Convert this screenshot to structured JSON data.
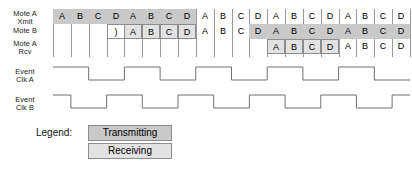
{
  "diagram": {
    "rows": [
      {
        "id": "mote-a-xmit",
        "label_line1": "Mote A",
        "label_line2": "Xmit"
      },
      {
        "id": "mote-b",
        "label_line1": "Mote B",
        "label_line2": ""
      },
      {
        "id": "mote-a-rcv",
        "label_line1": "Mote A",
        "label_line2": "Rcv"
      }
    ],
    "clocks": [
      {
        "id": "event-clk-a",
        "label_line1": "Event",
        "label_line2": "Clk A"
      },
      {
        "id": "event-clk-b",
        "label_line1": "Event",
        "label_line2": "Clk B"
      }
    ],
    "column_count": 20,
    "slot_labels": [
      "A",
      "B",
      "C",
      "D"
    ],
    "rows_cells": [
      {
        "row": "mote-a-xmit",
        "cells": [
          {
            "col": 0,
            "text": "A",
            "state": "transmitting",
            "boxed": false
          },
          {
            "col": 1,
            "text": "B",
            "state": "transmitting",
            "boxed": false
          },
          {
            "col": 2,
            "text": "C",
            "state": "transmitting",
            "boxed": false
          },
          {
            "col": 3,
            "text": "D",
            "state": "transmitting",
            "boxed": false
          },
          {
            "col": 4,
            "text": "A",
            "state": "transmitting",
            "boxed": false
          },
          {
            "col": 5,
            "text": "B",
            "state": "transmitting",
            "boxed": false
          },
          {
            "col": 6,
            "text": "C",
            "state": "transmitting",
            "boxed": false
          },
          {
            "col": 7,
            "text": "D",
            "state": "transmitting",
            "boxed": false
          },
          {
            "col": 8,
            "text": "A",
            "state": "idle",
            "boxed": false
          },
          {
            "col": 9,
            "text": "B",
            "state": "idle",
            "boxed": false
          },
          {
            "col": 10,
            "text": "C",
            "state": "idle",
            "boxed": false
          },
          {
            "col": 11,
            "text": "D",
            "state": "idle",
            "boxed": false
          },
          {
            "col": 12,
            "text": "A",
            "state": "idle",
            "boxed": false
          },
          {
            "col": 13,
            "text": "B",
            "state": "idle",
            "boxed": false
          },
          {
            "col": 14,
            "text": "C",
            "state": "idle",
            "boxed": false
          },
          {
            "col": 15,
            "text": "D",
            "state": "idle",
            "boxed": false
          },
          {
            "col": 16,
            "text": "A",
            "state": "idle",
            "boxed": false
          },
          {
            "col": 17,
            "text": "B",
            "state": "idle",
            "boxed": false
          },
          {
            "col": 18,
            "text": "C",
            "state": "idle",
            "boxed": false
          },
          {
            "col": 19,
            "text": "D",
            "state": "idle",
            "boxed": false
          }
        ]
      },
      {
        "row": "mote-b",
        "cells": [
          {
            "col": 3,
            "text": ")",
            "state": "idle",
            "boxed": true
          },
          {
            "col": 4,
            "text": "A",
            "state": "receiving",
            "boxed": true
          },
          {
            "col": 5,
            "text": "B",
            "state": "receiving",
            "boxed": true
          },
          {
            "col": 6,
            "text": "C",
            "state": "receiving",
            "boxed": true
          },
          {
            "col": 7,
            "text": "D",
            "state": "receiving",
            "boxed": true
          },
          {
            "col": 8,
            "text": "A",
            "state": "idle",
            "boxed": false
          },
          {
            "col": 9,
            "text": "B",
            "state": "idle",
            "boxed": false
          },
          {
            "col": 10,
            "text": "C",
            "state": "idle",
            "boxed": false
          },
          {
            "col": 11,
            "text": "D",
            "state": "transmitting",
            "boxed": false
          },
          {
            "col": 12,
            "text": "A",
            "state": "transmitting",
            "boxed": false
          },
          {
            "col": 13,
            "text": "B",
            "state": "transmitting",
            "boxed": false
          },
          {
            "col": 14,
            "text": "C",
            "state": "transmitting",
            "boxed": false
          },
          {
            "col": 15,
            "text": "D",
            "state": "transmitting",
            "boxed": false
          },
          {
            "col": 16,
            "text": "A",
            "state": "transmitting",
            "boxed": false
          },
          {
            "col": 17,
            "text": "B",
            "state": "transmitting",
            "boxed": false
          },
          {
            "col": 18,
            "text": "C",
            "state": "transmitting",
            "boxed": false
          },
          {
            "col": 19,
            "text": "D",
            "state": "transmitting",
            "boxed": false
          }
        ]
      },
      {
        "row": "mote-a-rcv",
        "cells": [
          {
            "col": 12,
            "text": "A",
            "state": "receiving",
            "boxed": true
          },
          {
            "col": 13,
            "text": "B",
            "state": "receiving",
            "boxed": true
          },
          {
            "col": 14,
            "text": "C",
            "state": "receiving",
            "boxed": true
          },
          {
            "col": 15,
            "text": "D",
            "state": "receiving",
            "boxed": true
          },
          {
            "col": 16,
            "text": "A",
            "state": "idle",
            "boxed": false
          },
          {
            "col": 17,
            "text": "B",
            "state": "idle",
            "boxed": false
          },
          {
            "col": 18,
            "text": "C",
            "state": "idle",
            "boxed": false
          },
          {
            "col": 19,
            "text": "D",
            "state": "idle",
            "boxed": false
          }
        ]
      }
    ],
    "waveforms": [
      {
        "id": "event-clk-a",
        "start_level": "low",
        "period_cols": 4,
        "high_cols": 2,
        "phase_cols": 0
      },
      {
        "id": "event-clk-b",
        "start_level": "low",
        "period_cols": 4,
        "high_cols": 2,
        "phase_cols": -1
      }
    ]
  },
  "legend": {
    "title": "Legend:",
    "items": [
      {
        "id": "transmitting",
        "label": "Transmitting",
        "color": "#c9c9c9"
      },
      {
        "id": "receiving",
        "label": "Receiving",
        "color": "#e2e2e2"
      }
    ]
  },
  "colors": {
    "transmitting": "#c9c9c9",
    "receiving": "#e2e2e2",
    "grid_line": "#9a9a9a",
    "box_border": "#8d8d8d",
    "wave_stroke": "#6f6f6f",
    "text": "#111111",
    "background": "#ffffff"
  }
}
